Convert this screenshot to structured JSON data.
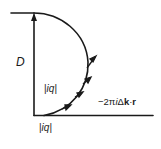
{
  "diagram": {
    "type": "vector-sum-arc",
    "colors": {
      "line": "#1a1a1a",
      "background": "#ffffff"
    },
    "labels": {
      "D": "D",
      "iq_middle": "|iq|",
      "iq_bottom": "|iq|",
      "phase": "−2πiΔk·r"
    },
    "phase_parts": {
      "prefix": "−2π",
      "i": "i",
      "delta": "Δ",
      "k": "k",
      "dot": "·",
      "r": "r"
    },
    "elements": [
      "vertical resultant vector D (arrow pointing up)",
      "top horizontal reference line",
      "bottom horizontal reference line",
      "semicircular arc of summed phasors",
      "small phasor arrows along lower arc"
    ]
  }
}
